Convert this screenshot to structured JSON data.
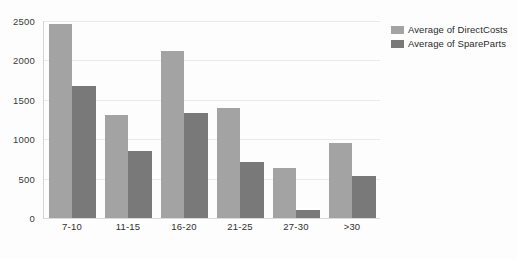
{
  "chart_data": {
    "type": "bar",
    "title": "",
    "subtitle": "",
    "xlabel": "",
    "ylabel": "",
    "categories": [
      "7-10",
      "11-15",
      "16-20",
      "21-25",
      "27-30",
      ">30"
    ],
    "series": [
      {
        "name": "Average of DirectCosts",
        "color": "#a3a3a3",
        "values": [
          2460,
          1310,
          2120,
          1390,
          630,
          955
        ]
      },
      {
        "name": "Average of SpareParts",
        "color": "#797979",
        "values": [
          1680,
          855,
          1330,
          705,
          100,
          530
        ]
      }
    ],
    "ylim": [
      0,
      2500
    ],
    "yticks": [
      0,
      500,
      1000,
      1500,
      2000,
      2500
    ],
    "ytick_labels": [
      "0",
      "500",
      "1000",
      "1500",
      "2000",
      "2500"
    ],
    "grid": true,
    "grid_axis": "y",
    "legend": {
      "position": "right",
      "entries": [
        {
          "label": "Average of DirectCosts",
          "color": "#a3a3a3",
          "swatch": "legend-swatch-directcosts"
        },
        {
          "label": "Average of SpareParts",
          "color": "#797979",
          "swatch": "legend-swatch-spareparts"
        }
      ]
    },
    "background_color": "#fdfdfd",
    "gridline_color": "#e9e9e9"
  }
}
